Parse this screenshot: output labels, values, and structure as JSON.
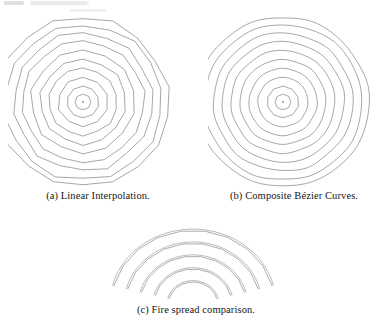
{
  "figure": {
    "id": "fire-spread-figure",
    "line_color": "#8a8a8a",
    "background": "#ffffff",
    "subfigures": [
      {
        "key": "a",
        "label": "(a) Linear Interpolation.",
        "render": "polygon",
        "description": "Concentric isochrone polygons produced by linear interpolation between fire-front points.",
        "vertices": 18,
        "ring_count": 10,
        "center": [
          75,
          88
        ],
        "radii": [
          8,
          16,
          25,
          34,
          43,
          52,
          61,
          70,
          79,
          86
        ],
        "has_center_dot": true
      },
      {
        "key": "b",
        "label": "(b) Composite Bézier Curves.",
        "render": "circle",
        "description": "Concentric isochrone rings produced by composite cubic Bézier curves.",
        "vertices": 18,
        "ring_count": 10,
        "center": [
          75,
          88
        ],
        "radii": [
          8,
          16,
          25,
          34,
          43,
          52,
          61,
          70,
          79,
          86
        ],
        "has_center_dot": true
      },
      {
        "key": "c",
        "label": "(c) Fire spread comparison.",
        "render": "arcs",
        "description": "Overlay comparison of five fire-front arcs: linear interpolation versus composite Bézier curves.",
        "arc_count": 5,
        "arc_radii": [
          24,
          38,
          52,
          66,
          80
        ],
        "center": [
          95,
          92
        ]
      }
    ]
  },
  "chart_data": {
    "type": "line",
    "title": "Fire spread comparison",
    "xlabel": "",
    "ylabel": "",
    "panels": [
      {
        "panel": "a",
        "title": "(a) Linear Interpolation.",
        "series": [
          {
            "name": "isochrone-polygons",
            "shape": "regular-polygon",
            "sides": 18,
            "radii": [
              8,
              16,
              25,
              34,
              43,
              52,
              61,
              70,
              79,
              86
            ]
          }
        ]
      },
      {
        "panel": "b",
        "title": "(b) Composite Bézier Curves.",
        "series": [
          {
            "name": "isochrone-circles",
            "shape": "circle",
            "radii": [
              8,
              16,
              25,
              34,
              43,
              52,
              61,
              70,
              79,
              86
            ]
          }
        ]
      },
      {
        "panel": "c",
        "title": "(c) Fire spread comparison.",
        "series": [
          {
            "name": "linear-interpolation-arcs",
            "shape": "polyline-arc",
            "radii": [
              24,
              38,
              52,
              66,
              80
            ],
            "sweep_degrees": 150
          },
          {
            "name": "bezier-arcs",
            "shape": "smooth-arc",
            "radii": [
              24,
              38,
              52,
              66,
              80
            ],
            "sweep_degrees": 150
          }
        ]
      }
    ],
    "legend_position": "none",
    "grid": false
  }
}
